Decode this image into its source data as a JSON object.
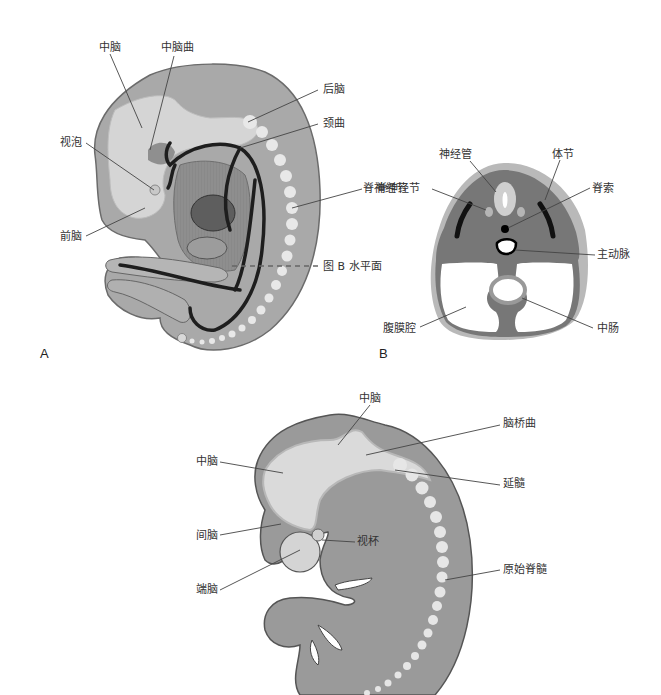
{
  "figure": {
    "panel_a": {
      "letter": "A",
      "labels": {
        "midbrain": "中脑",
        "midbrain_flexure": "中脑曲",
        "hindbrain": "后脑",
        "cervical_flexure": "颈曲",
        "optic_vesicle": "视泡",
        "forebrain": "前脑",
        "spinal_ganglion": "脊神经节",
        "plane_b": "图 B 水平面"
      }
    },
    "panel_b": {
      "letter": "B",
      "labels": {
        "neural_tube": "神经管",
        "somite": "体节",
        "spinal_ganglion": "脊神经节",
        "notochord": "脊索",
        "aorta": "主动脉",
        "peritoneal_cavity": "腹膜腔",
        "midgut": "中肠"
      }
    },
    "panel_c": {
      "labels": {
        "midbrain_top": "中脑",
        "pontine_flexure": "脑桥曲",
        "midbrain_left": "中脑",
        "medulla": "延髓",
        "diencephalon": "间脑",
        "optic_cup": "视杯",
        "telencephalon": "端脑",
        "primitive_spinal_cord": "原始脊髓"
      }
    }
  }
}
